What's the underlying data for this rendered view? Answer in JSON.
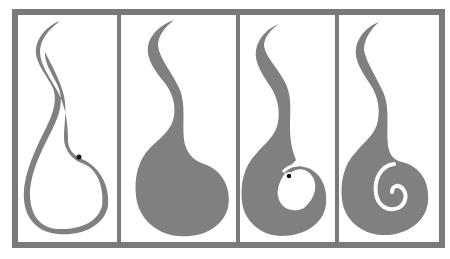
{
  "figure": {
    "panel_count": 4,
    "colors": {
      "frame": "#7a7a7a",
      "shape": "#808080",
      "background": "#ffffff",
      "dot": "#111111"
    },
    "panels": [
      {
        "id": "panel-1",
        "stage": "outline loop with dot"
      },
      {
        "id": "panel-2",
        "stage": "filled comma shape"
      },
      {
        "id": "panel-3",
        "stage": "filled shape with notch and dot"
      },
      {
        "id": "panel-4",
        "stage": "filled shape with spiral curl"
      }
    ]
  }
}
